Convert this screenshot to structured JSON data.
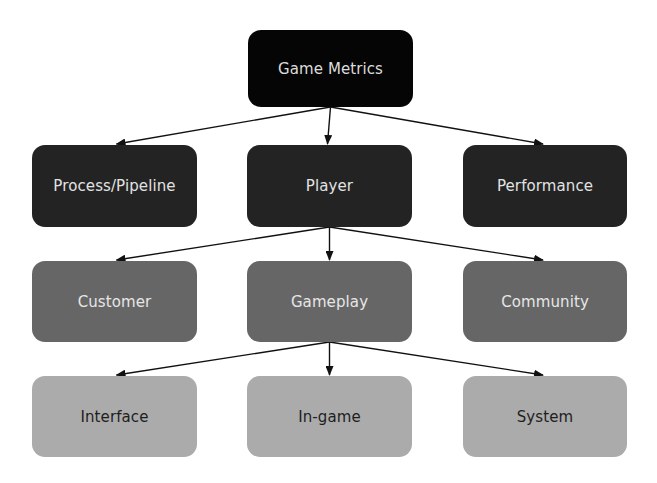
{
  "diagram": {
    "type": "hierarchy",
    "colors": {
      "level0": "#050505",
      "level1": "#232323",
      "level2": "#666666",
      "level3": "#ababab",
      "arrow": "#111111"
    },
    "root": {
      "id": "game-metrics",
      "label": "Game Metrics"
    },
    "level1": [
      {
        "id": "process-pipeline",
        "label": "Process/Pipeline"
      },
      {
        "id": "player",
        "label": "Player"
      },
      {
        "id": "performance",
        "label": "Performance"
      }
    ],
    "level2": [
      {
        "id": "customer",
        "label": "Customer"
      },
      {
        "id": "gameplay",
        "label": "Gameplay"
      },
      {
        "id": "community",
        "label": "Community"
      }
    ],
    "level3": [
      {
        "id": "interface",
        "label": "Interface"
      },
      {
        "id": "in-game",
        "label": "In-game"
      },
      {
        "id": "system",
        "label": "System"
      }
    ],
    "edges": [
      {
        "from": "game-metrics",
        "to": "process-pipeline"
      },
      {
        "from": "game-metrics",
        "to": "player"
      },
      {
        "from": "game-metrics",
        "to": "performance"
      },
      {
        "from": "player",
        "to": "customer"
      },
      {
        "from": "player",
        "to": "gameplay"
      },
      {
        "from": "player",
        "to": "community"
      },
      {
        "from": "gameplay",
        "to": "interface"
      },
      {
        "from": "gameplay",
        "to": "in-game"
      },
      {
        "from": "gameplay",
        "to": "system"
      }
    ]
  }
}
